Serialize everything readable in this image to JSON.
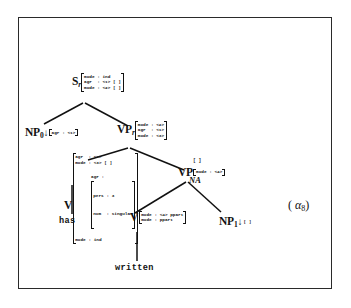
{
  "figure": {
    "kind": "tag-elementary-tree",
    "tree_label_open": "(",
    "tree_label_symbol": "α",
    "tree_label_index": "8",
    "tree_label_close": ")",
    "border_color": "#2a2a2a",
    "background": "#ffffff",
    "ink_color": "#111111"
  },
  "nodes": {
    "s_root": {
      "category": "S",
      "subscript": "r",
      "features": [
        "mode : ind",
        "agr  : <1> [ ]",
        "mode : <2> [ ]"
      ]
    },
    "np0": {
      "category": "NP",
      "subscript": "0",
      "substitution_marker": "↓",
      "features": [
        "agr : <1>"
      ]
    },
    "vp_root": {
      "category": "VP",
      "subscript": "r",
      "features": [
        "mode : <2>",
        "agr  : <1>",
        "mode : <3>"
      ]
    },
    "v_has": {
      "category": "V",
      "top_features": [
        "agr  : <1>",
        "mode : <3> [ ]"
      ],
      "agr_label": "agr : ",
      "agr_sub_features": [
        "pers : 3",
        "num  : singular"
      ],
      "bottom_features": [
        "mode : ind"
      ]
    },
    "vp_foot": {
      "category": "VP",
      "null_adjunction": "NA",
      "top_empty": "[ ]",
      "features": [
        "mode : <4>"
      ]
    },
    "v_written": {
      "category": "V",
      "features": [
        "mode : <4> ppart",
        "mode : ppart"
      ]
    },
    "np1": {
      "category": "NP",
      "subscript": "1",
      "substitution_marker": "↓",
      "features": [
        "[ ]"
      ]
    }
  },
  "terminals": {
    "has": "has",
    "written": "written"
  },
  "edges": [
    {
      "from": "s_root",
      "to": "np0"
    },
    {
      "from": "s_root",
      "to": "vp_root"
    },
    {
      "from": "vp_root",
      "to": "v_has"
    },
    {
      "from": "vp_root",
      "to": "vp_foot"
    },
    {
      "from": "vp_foot",
      "to": "v_written"
    },
    {
      "from": "vp_foot",
      "to": "np1"
    },
    {
      "from": "v_has",
      "to": "has"
    },
    {
      "from": "v_written",
      "to": "written"
    }
  ]
}
